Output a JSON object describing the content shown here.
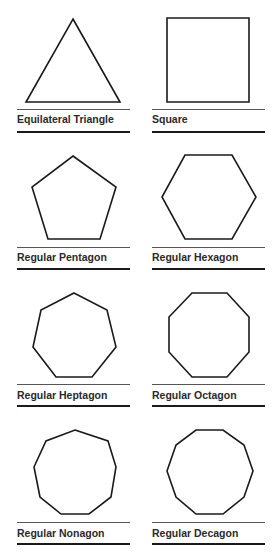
{
  "shapes": [
    {
      "name": "Equilateral Triangle",
      "sides": 3
    },
    {
      "name": "Square",
      "sides": 4
    },
    {
      "name": "Regular Pentagon",
      "sides": 5
    },
    {
      "name": "Regular Hexagon",
      "sides": 6
    },
    {
      "name": "Regular Heptagon",
      "sides": 7
    },
    {
      "name": "Regular Octagon",
      "sides": 8
    },
    {
      "name": "Regular Nonagon",
      "sides": 9
    },
    {
      "name": "Regular Decagon",
      "sides": 10
    }
  ],
  "colors": {
    "stroke": "#1a1a1a",
    "background": "#ffffff"
  }
}
